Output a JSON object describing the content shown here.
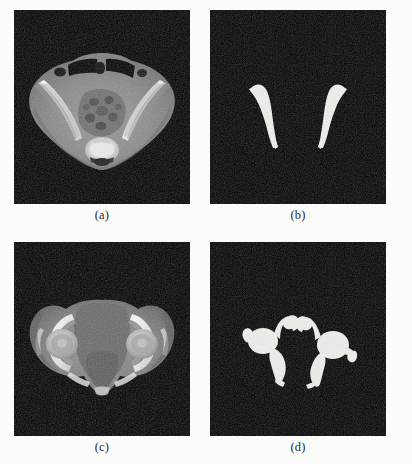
{
  "figure": {
    "background_color": "#fbfbfa",
    "panel_background_color": "#000000",
    "mask_color": "#f2f2ee",
    "layout": {
      "rows": 2,
      "columns": 2,
      "panel_width": 176,
      "panel_height": 194
    },
    "panels": [
      {
        "id": "a",
        "caption": "(a)",
        "kind": "grayscale-ct-slice",
        "description": "Axial CT slice of the pelvis at the level of the iliac wings and sacrum",
        "modality": "CT",
        "position": "top-left"
      },
      {
        "id": "b",
        "caption": "(b)",
        "kind": "binary-segmentation-mask",
        "description": "Binary bone segmentation mask of the iliac bones corresponding to panel (a)",
        "structures": [
          "left iliac bone",
          "right iliac bone"
        ],
        "position": "top-right"
      },
      {
        "id": "c",
        "caption": "(c)",
        "kind": "grayscale-ct-slice",
        "description": "Axial CT slice of the pelvis at the level of the femoral heads and acetabula",
        "modality": "CT",
        "position": "bottom-left"
      },
      {
        "id": "d",
        "caption": "(d)",
        "kind": "binary-segmentation-mask",
        "description": "Binary bone segmentation mask of the femoral heads and acetabula corresponding to panel (c)",
        "structures": [
          "left femoral head",
          "right femoral head",
          "left acetabulum",
          "right acetabulum"
        ],
        "position": "bottom-right"
      }
    ]
  }
}
